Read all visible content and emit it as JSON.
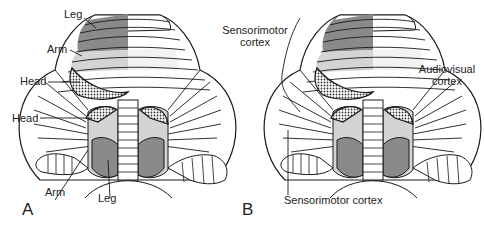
{
  "figure": {
    "panels": [
      {
        "id": "A",
        "letter": "A",
        "labels": {
          "leg_top": "Leg",
          "arm_top": "Arm",
          "head_top": "Head",
          "head_bottom": "Head",
          "arm_bottom": "Arm",
          "leg_bottom": "Leg"
        }
      },
      {
        "id": "B",
        "letter": "B",
        "labels": {
          "sensorimotor_top_line1": "Sensorimotor",
          "sensorimotor_top_line2": "cortex",
          "audiovisual_line1": "Audiovisual",
          "audiovisual_line2": "cortex",
          "sensorimotor_bottom": "Sensorimotor cortex"
        }
      }
    ],
    "colors": {
      "dark_gray": "#8a8a8a",
      "light_gray": "#d4d4d4",
      "stipple": "#6a6a6a",
      "outline": "#1a1a1a",
      "background": "#ffffff"
    }
  }
}
